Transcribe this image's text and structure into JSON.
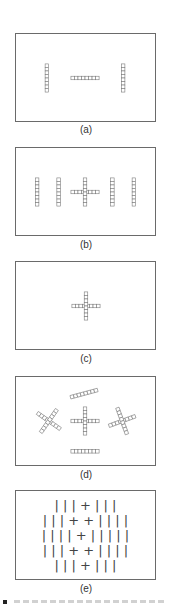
{
  "figure": {
    "panels": [
      {
        "id": "a",
        "label": "(a)",
        "description": "Two vertical bars flanking one horizontal bar",
        "elements": [
          {
            "type": "bar",
            "orientation": "vertical",
            "cells": 8
          },
          {
            "type": "bar",
            "orientation": "horizontal",
            "cells": 8
          },
          {
            "type": "bar",
            "orientation": "vertical",
            "cells": 8
          }
        ]
      },
      {
        "id": "b",
        "label": "(b)",
        "description": "Central cross flanked by two vertical bars on each side",
        "elements": [
          {
            "type": "bar",
            "orientation": "vertical",
            "cells": 8
          },
          {
            "type": "bar",
            "orientation": "vertical",
            "cells": 8
          },
          {
            "type": "cross",
            "cells": 8
          },
          {
            "type": "bar",
            "orientation": "vertical",
            "cells": 8
          },
          {
            "type": "bar",
            "orientation": "vertical",
            "cells": 8
          }
        ]
      },
      {
        "id": "c",
        "label": "(c)",
        "description": "Single central cross",
        "elements": [
          {
            "type": "cross",
            "cells": 8
          }
        ]
      },
      {
        "id": "d",
        "label": "(d)",
        "description": "Central cross surrounded by rotated crosses and tilted/horizontal bars",
        "elements": [
          {
            "type": "bar",
            "orientation": "tilted",
            "angle_deg": -15,
            "cells": 8
          },
          {
            "type": "cross",
            "angle_deg": 35,
            "cells": 8
          },
          {
            "type": "cross",
            "angle_deg": 0,
            "cells": 8
          },
          {
            "type": "cross",
            "angle_deg": -20,
            "cells": 8
          },
          {
            "type": "bar",
            "orientation": "horizontal",
            "cells": 8
          }
        ]
      },
      {
        "id": "e",
        "label": "(e)",
        "description": "Rows of line and plus symbols",
        "rows": [
          "| | | + | | |",
          "| | | + + | | | |",
          "| | | | + | | | | |",
          "| | | + + | | | |",
          "| | | + | | |"
        ]
      }
    ]
  }
}
